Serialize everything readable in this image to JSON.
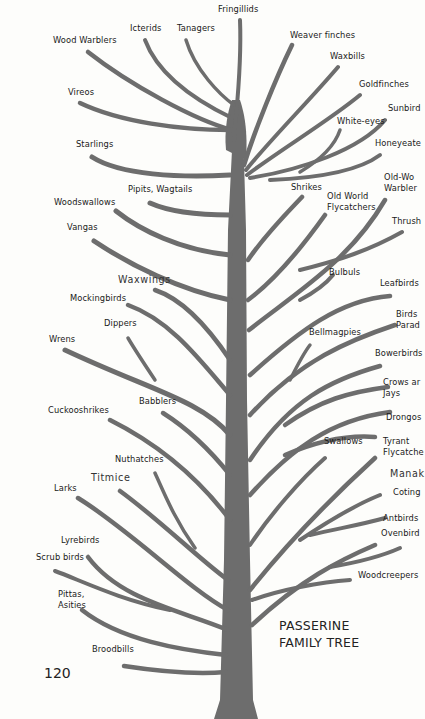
{
  "title": {
    "line1": "PASSERINE",
    "line2": "FAMILY TREE"
  },
  "page_number": "120",
  "colors": {
    "branch": "#6d6d6d",
    "text": "#1a1a1a",
    "background": "#fdfdfb"
  },
  "labels": [
    {
      "text": "Fringillids",
      "x": 218,
      "y": 4
    },
    {
      "text": "Icterids",
      "x": 130,
      "y": 23
    },
    {
      "text": "Tanagers",
      "x": 177,
      "y": 23
    },
    {
      "text": "Wood Warblers",
      "x": 53,
      "y": 35
    },
    {
      "text": "Weaver finches",
      "x": 290,
      "y": 30
    },
    {
      "text": "Waxbills",
      "x": 330,
      "y": 51
    },
    {
      "text": "Goldfinches",
      "x": 359,
      "y": 79
    },
    {
      "text": "Vireos",
      "x": 68,
      "y": 87
    },
    {
      "text": "Sunbird",
      "x": 388,
      "y": 103
    },
    {
      "text": "White-eyes",
      "x": 337,
      "y": 116
    },
    {
      "text": "Honeyeate",
      "x": 375,
      "y": 138
    },
    {
      "text": "Starlings",
      "x": 76,
      "y": 139
    },
    {
      "text": "Old-Wo\nWarbler",
      "x": 384,
      "y": 172
    },
    {
      "text": "Shrikes",
      "x": 291,
      "y": 182
    },
    {
      "text": "Pipits, Wagtails",
      "x": 128,
      "y": 184
    },
    {
      "text": "Old World\nFlycatchers",
      "x": 327,
      "y": 191
    },
    {
      "text": "Woodswallows",
      "x": 54,
      "y": 197
    },
    {
      "text": "Thrush",
      "x": 392,
      "y": 216
    },
    {
      "text": "Vangas",
      "x": 67,
      "y": 222
    },
    {
      "text": "Bulbuls",
      "x": 329,
      "y": 267
    },
    {
      "text": "Waxwings",
      "x": 118,
      "y": 274,
      "big": true
    },
    {
      "text": "Leafbirds",
      "x": 380,
      "y": 278
    },
    {
      "text": "Mockingbirds",
      "x": 70,
      "y": 293
    },
    {
      "text": "Birds\nParad",
      "x": 396,
      "y": 309
    },
    {
      "text": "Dippers",
      "x": 104,
      "y": 318
    },
    {
      "text": "Bellmagpies",
      "x": 309,
      "y": 327
    },
    {
      "text": "Wrens",
      "x": 49,
      "y": 334
    },
    {
      "text": "Bowerbirds",
      "x": 375,
      "y": 348
    },
    {
      "text": "Crows ar\nJays",
      "x": 383,
      "y": 377
    },
    {
      "text": "Babblers",
      "x": 139,
      "y": 396
    },
    {
      "text": "Cuckooshrikes",
      "x": 48,
      "y": 405
    },
    {
      "text": "Drongos",
      "x": 386,
      "y": 412
    },
    {
      "text": "Swallows",
      "x": 324,
      "y": 436
    },
    {
      "text": "Tyrant\nFlycatche",
      "x": 383,
      "y": 436
    },
    {
      "text": "Nuthatches",
      "x": 115,
      "y": 454
    },
    {
      "text": "Titmice",
      "x": 91,
      "y": 472,
      "big": true
    },
    {
      "text": "Manak",
      "x": 390,
      "y": 468,
      "big": true
    },
    {
      "text": "Larks",
      "x": 54,
      "y": 483
    },
    {
      "text": "Coting",
      "x": 393,
      "y": 487
    },
    {
      "text": "Antbirds",
      "x": 383,
      "y": 513
    },
    {
      "text": "Ovenbird",
      "x": 381,
      "y": 528
    },
    {
      "text": "Lyrebirds",
      "x": 61,
      "y": 535
    },
    {
      "text": "Scrub birds",
      "x": 36,
      "y": 552
    },
    {
      "text": "Woodcreepers",
      "x": 358,
      "y": 570
    },
    {
      "text": "Pittas,\nAsities",
      "x": 58,
      "y": 589
    },
    {
      "text": "Broodbills",
      "x": 92,
      "y": 644
    }
  ]
}
